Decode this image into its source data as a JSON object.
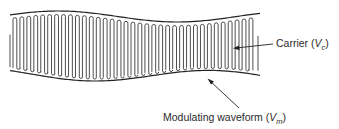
{
  "diagram": {
    "labels": {
      "carrier": {
        "text": "Carrier (",
        "symbol": "V",
        "subscript": "c",
        "close": ")"
      },
      "modulating": {
        "text": "Modulating waveform (",
        "symbol": "V",
        "subscript": "m",
        "close": ")"
      }
    },
    "carrier_cycles": 35,
    "colors": {
      "line": "#333333",
      "background": "#ffffff"
    }
  }
}
